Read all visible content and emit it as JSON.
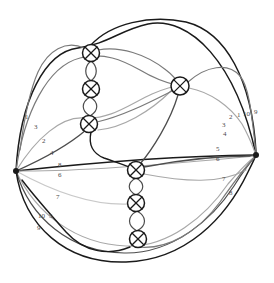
{
  "diagram": {
    "width": 274,
    "height": 283,
    "background": "#ffffff"
  },
  "palette": {
    "black": "#1a1a1a",
    "dark_gray": "#4d4d4d",
    "mid_gray": "#7a7a7a",
    "light_gray": "#a8a8a8",
    "pale_gray": "#c9c9c9",
    "label": "#4a4a4a",
    "node_stroke": "#1a1a1a",
    "node_fill": "#ffffff"
  },
  "vertices": [
    {
      "id": "left-vertex",
      "name": "left-vertex",
      "x": 16,
      "y": 171,
      "r": 3.0,
      "degree": 10
    },
    {
      "id": "right-vertex",
      "name": "right-vertex",
      "x": 256,
      "y": 155,
      "r": 3.0,
      "degree": 10
    }
  ],
  "crossings": [
    {
      "id": "c1",
      "name": "crossing-top-1",
      "x": 91,
      "y": 53,
      "r": 8.5
    },
    {
      "id": "c2",
      "name": "crossing-top-2",
      "x": 91,
      "y": 89,
      "r": 8.5
    },
    {
      "id": "c3",
      "name": "crossing-top-3",
      "x": 89,
      "y": 124,
      "r": 8.5
    },
    {
      "id": "c4",
      "name": "crossing-right-1",
      "x": 180,
      "y": 86,
      "r": 9.0
    },
    {
      "id": "c5",
      "name": "crossing-bottom-1",
      "x": 136,
      "y": 170,
      "r": 8.5
    },
    {
      "id": "c6",
      "name": "crossing-bottom-2",
      "x": 136,
      "y": 203,
      "r": 8.5
    },
    {
      "id": "c7",
      "name": "crossing-bottom-3",
      "x": 138,
      "y": 239,
      "r": 8.5
    }
  ],
  "bigons": [
    {
      "name": "bigon-top-a",
      "x": 91,
      "y1": 61,
      "y2": 81,
      "w": 7
    },
    {
      "name": "bigon-top-b",
      "x": 90,
      "y1": 97,
      "y2": 116,
      "w": 9
    },
    {
      "name": "bigon-bottom-a",
      "x": 136,
      "y1": 178,
      "y2": 195,
      "w": 9
    },
    {
      "name": "bigon-bottom-b",
      "x": 137,
      "y1": 211,
      "y2": 231,
      "w": 10
    }
  ],
  "edge_labels_left": [
    {
      "id": "L1",
      "text": "1",
      "x": 25,
      "y": 114
    },
    {
      "id": "L3",
      "text": "3",
      "x": 34,
      "y": 124
    },
    {
      "id": "L2",
      "text": "2",
      "x": 42,
      "y": 138
    },
    {
      "id": "L4",
      "text": "4",
      "x": 50,
      "y": 150
    },
    {
      "id": "L8",
      "text": "8",
      "x": 58,
      "y": 162
    },
    {
      "id": "L6",
      "text": "6",
      "x": 58,
      "y": 172
    },
    {
      "id": "L7",
      "text": "7",
      "x": 56,
      "y": 194
    },
    {
      "id": "L10",
      "text": "10",
      "x": 38,
      "y": 213
    },
    {
      "id": "L5",
      "text": "5",
      "x": 49,
      "y": 213
    },
    {
      "id": "L9",
      "text": "9",
      "x": 37,
      "y": 225
    }
  ],
  "edge_labels_right": [
    {
      "id": "R3",
      "text": "3",
      "x": 222,
      "y": 122
    },
    {
      "id": "R2",
      "text": "2",
      "x": 229,
      "y": 114
    },
    {
      "id": "R1",
      "text": "1",
      "x": 237,
      "y": 112
    },
    {
      "id": "R10",
      "text": "10",
      "x": 243,
      "y": 111
    },
    {
      "id": "R9",
      "text": "9",
      "x": 254,
      "y": 109
    },
    {
      "id": "R4",
      "text": "4",
      "x": 223,
      "y": 131
    },
    {
      "id": "R5",
      "text": "5",
      "x": 216,
      "y": 146
    },
    {
      "id": "R6",
      "text": "6",
      "x": 216,
      "y": 156
    },
    {
      "id": "R7",
      "text": "7",
      "x": 222,
      "y": 176
    },
    {
      "id": "R8",
      "text": "8",
      "x": 229,
      "y": 190
    }
  ],
  "edges": [
    {
      "name": "edge-1-outer-top",
      "color": "black",
      "width": 1.5,
      "d": "M 16 171 C 20 100, 45 52, 78 48 C 108 44, 120 30, 148 24 C 190 16, 236 62, 256 155"
    },
    {
      "name": "edge-9-outer-right",
      "color": "black",
      "width": 1.5,
      "d": "M 91 45 C 110 24, 150 14, 186 22 C 226 32, 252 80, 256 152"
    },
    {
      "name": "edge-3-upper-left",
      "color": "mid_gray",
      "width": 1.2,
      "d": "M 16 171 C 24 112, 48 66, 80 58 C 104 52, 122 60, 140 70 C 160 82, 172 84, 180 86"
    },
    {
      "name": "edge-2-left-mid",
      "color": "light_gray",
      "width": 1.2,
      "d": "M 16 171 C 36 138, 62 116, 84 118 C 110 120, 130 104, 152 94 C 166 88, 174 86, 180 86"
    },
    {
      "name": "edge-4-left-diag",
      "color": "dark_gray",
      "width": 1.3,
      "d": "M 16 171 C 50 156, 72 142, 86 130"
    },
    {
      "name": "edge-8-left-straight",
      "color": "black",
      "width": 1.4,
      "d": "M 16 171 C 80 164, 170 156, 256 155"
    },
    {
      "name": "edge-6-left-straight2",
      "color": "light_gray",
      "width": 1.1,
      "d": "M 16 171 C 80 172, 172 164, 256 156"
    },
    {
      "name": "edge-7-left-low",
      "color": "pale_gray",
      "width": 1.2,
      "d": "M 16 171 C 54 192, 94 206, 130 204"
    },
    {
      "name": "edge-5-left-lower",
      "color": "light_gray",
      "width": 1.2,
      "d": "M 16 171 C 36 214, 76 244, 126 246 C 168 248, 206 216, 228 184 C 240 170, 250 160, 256 156"
    },
    {
      "name": "edge-10-left-lower2",
      "color": "dark_gray",
      "width": 1.2,
      "d": "M 16 171 C 30 218, 70 252, 124 253 C 172 254, 212 220, 234 186 C 244 170, 252 160, 256 156"
    },
    {
      "name": "edge-9-left-lowest",
      "color": "black",
      "width": 1.5,
      "d": "M 16 171 C 24 226, 66 264, 126 262 C 186 260, 226 218, 248 172 C 252 164, 255 158, 256 155"
    },
    {
      "name": "edge-chain-top-in",
      "color": "black",
      "width": 1.4,
      "d": "M 91 132 C 88 146, 94 154, 104 158 C 118 163, 128 166, 136 170"
    },
    {
      "name": "edge-c4-right-a",
      "color": "mid_gray",
      "width": 1.2,
      "d": "M 188 82 C 206 66, 228 62, 240 76 C 250 88, 252 120, 256 152"
    },
    {
      "name": "edge-c4-right-b",
      "color": "light_gray",
      "width": 1.2,
      "d": "M 189 88 C 210 92, 230 106, 242 124 C 250 138, 254 150, 256 155"
    },
    {
      "name": "edge-c4-down",
      "color": "dark_gray",
      "width": 1.3,
      "d": "M 178 95 C 170 122, 152 150, 140 164"
    },
    {
      "name": "edge-c4-left-low",
      "color": "light_gray",
      "width": 1.2,
      "d": "M 172 90 C 150 112, 122 128, 98 130"
    },
    {
      "name": "edge-bottom-right-1",
      "color": "dark_gray",
      "width": 1.3,
      "d": "M 144 167 C 180 160, 214 156, 250 156"
    },
    {
      "name": "edge-bottom-right-2",
      "color": "light_gray",
      "width": 1.2,
      "d": "M 144 174 C 186 182, 220 184, 246 170"
    },
    {
      "name": "edge-bottom-out-1",
      "color": "mid_gray",
      "width": 1.2,
      "d": "M 138 247 C 168 250, 198 232, 220 202 C 234 182, 246 166, 254 158"
    },
    {
      "name": "edge-bottom-out-2",
      "color": "black",
      "width": 1.4,
      "d": "M 130 247 C 108 256, 84 252, 66 232 C 50 214, 34 196, 22 180"
    },
    {
      "name": "edge-top-chain-out",
      "color": "mid_gray",
      "width": 1.2,
      "d": "M 98 50 C 120 46, 146 54, 166 70 C 174 76, 178 82, 180 86"
    },
    {
      "name": "edge-top-chain-left",
      "color": "mid_gray",
      "width": 1.2,
      "d": "M 84 48 C 66 40, 48 50, 38 72 C 30 90, 24 120, 20 150"
    },
    {
      "name": "edge-c3-right",
      "color": "mid_gray",
      "width": 1.2,
      "d": "M 97 122 C 124 116, 154 100, 174 90"
    }
  ],
  "counts": {
    "vertices": 2,
    "crossings": 7,
    "labels_per_vertex": 10
  }
}
